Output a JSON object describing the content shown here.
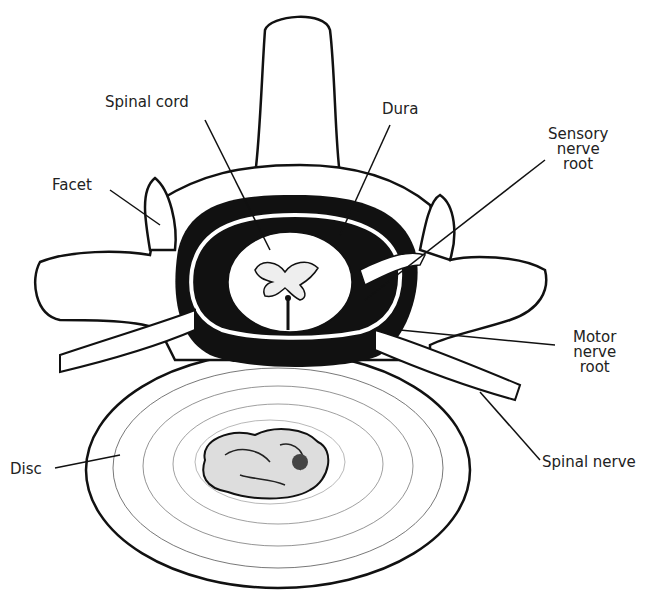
{
  "diagram": {
    "title": "",
    "labels": {
      "spinal_cord": "Spinal cord",
      "dura": "Dura",
      "sensory_nerve_root_1": "Sensory",
      "sensory_nerve_root_2": "nerve",
      "sensory_nerve_root_3": "root",
      "facet": "Facet",
      "motor_nerve_root_1": "Motor",
      "motor_nerve_root_2": "nerve",
      "motor_nerve_root_3": "root",
      "spinal_nerve": "Spinal nerve",
      "disc": "Disc"
    },
    "colors": {
      "ink": "#111111",
      "paper": "#ffffff",
      "bone": "#fafafa"
    }
  }
}
